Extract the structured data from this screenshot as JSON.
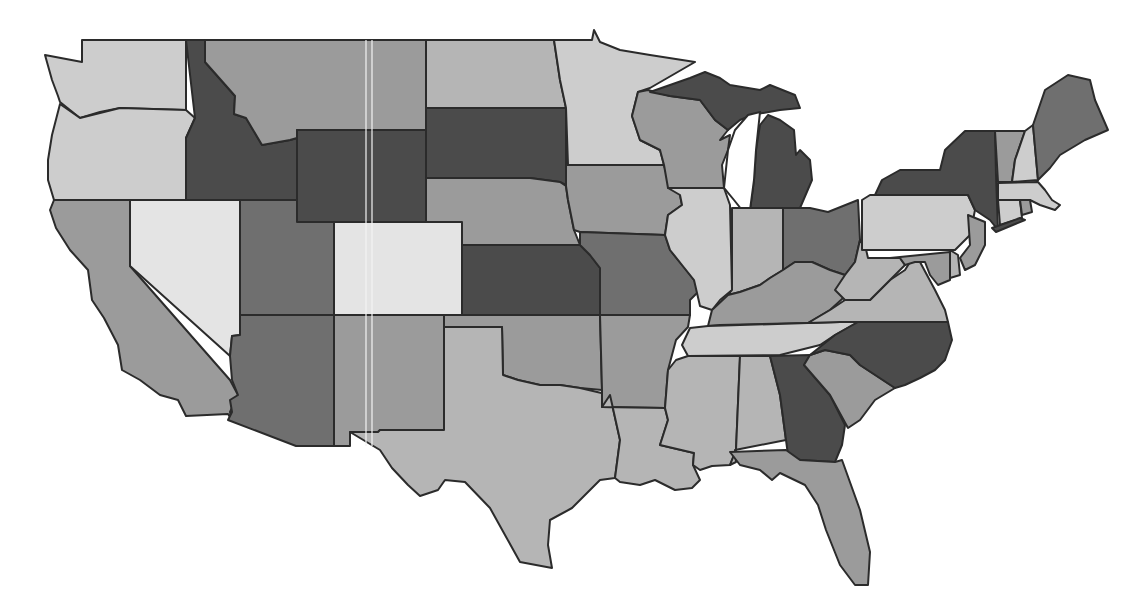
{
  "map": {
    "title": "",
    "type": "choropleth",
    "region": "United States (contiguous 48)",
    "legend": null,
    "shade_levels": {
      "1": "#e4e4e4",
      "2": "#cdcdcd",
      "3": "#b5b5b5",
      "4": "#9b9b9b",
      "5": "#6f6f6f",
      "6": "#4b4b4b"
    },
    "states": [
      {
        "id": "WA",
        "name": "Washington",
        "level": 2
      },
      {
        "id": "OR",
        "name": "Oregon",
        "level": 2
      },
      {
        "id": "CA",
        "name": "California",
        "level": 4
      },
      {
        "id": "NV",
        "name": "Nevada",
        "level": 1
      },
      {
        "id": "ID",
        "name": "Idaho",
        "level": 6
      },
      {
        "id": "MT",
        "name": "Montana",
        "level": 4
      },
      {
        "id": "WY",
        "name": "Wyoming",
        "level": 6
      },
      {
        "id": "UT",
        "name": "Utah",
        "level": 5
      },
      {
        "id": "AZ",
        "name": "Arizona",
        "level": 5
      },
      {
        "id": "CO",
        "name": "Colorado",
        "level": 1
      },
      {
        "id": "NM",
        "name": "New Mexico",
        "level": 4
      },
      {
        "id": "ND",
        "name": "North Dakota",
        "level": 3
      },
      {
        "id": "SD",
        "name": "South Dakota",
        "level": 6
      },
      {
        "id": "NE",
        "name": "Nebraska",
        "level": 4
      },
      {
        "id": "KS",
        "name": "Kansas",
        "level": 6
      },
      {
        "id": "OK",
        "name": "Oklahoma",
        "level": 4
      },
      {
        "id": "TX",
        "name": "Texas",
        "level": 3
      },
      {
        "id": "MN",
        "name": "Minnesota",
        "level": 2
      },
      {
        "id": "IA",
        "name": "Iowa",
        "level": 4
      },
      {
        "id": "MO",
        "name": "Missouri",
        "level": 5
      },
      {
        "id": "AR",
        "name": "Arkansas",
        "level": 4
      },
      {
        "id": "LA",
        "name": "Louisiana",
        "level": 3
      },
      {
        "id": "WI",
        "name": "Wisconsin",
        "level": 4
      },
      {
        "id": "IL",
        "name": "Illinois",
        "level": 2
      },
      {
        "id": "MI",
        "name": "Michigan",
        "level": 6
      },
      {
        "id": "IN",
        "name": "Indiana",
        "level": 3
      },
      {
        "id": "OH",
        "name": "Ohio",
        "level": 5
      },
      {
        "id": "KY",
        "name": "Kentucky",
        "level": 4
      },
      {
        "id": "TN",
        "name": "Tennessee",
        "level": 2
      },
      {
        "id": "MS",
        "name": "Mississippi",
        "level": 3
      },
      {
        "id": "AL",
        "name": "Alabama",
        "level": 3
      },
      {
        "id": "GA",
        "name": "Georgia",
        "level": 6
      },
      {
        "id": "FL",
        "name": "Florida",
        "level": 4
      },
      {
        "id": "SC",
        "name": "South Carolina",
        "level": 4
      },
      {
        "id": "NC",
        "name": "North Carolina",
        "level": 6
      },
      {
        "id": "VA",
        "name": "Virginia",
        "level": 3
      },
      {
        "id": "WV",
        "name": "West Virginia",
        "level": 3
      },
      {
        "id": "PA",
        "name": "Pennsylvania",
        "level": 2
      },
      {
        "id": "NY",
        "name": "New York",
        "level": 6
      },
      {
        "id": "NJ",
        "name": "New Jersey",
        "level": 4
      },
      {
        "id": "DE",
        "name": "Delaware",
        "level": 3
      },
      {
        "id": "MD",
        "name": "Maryland",
        "level": 4
      },
      {
        "id": "VT",
        "name": "Vermont",
        "level": 4
      },
      {
        "id": "NH",
        "name": "New Hampshire",
        "level": 2
      },
      {
        "id": "ME",
        "name": "Maine",
        "level": 5
      },
      {
        "id": "MA",
        "name": "Massachusetts",
        "level": 2
      },
      {
        "id": "CT",
        "name": "Connecticut",
        "level": 2
      },
      {
        "id": "RI",
        "name": "Rhode Island",
        "level": 4
      }
    ]
  }
}
